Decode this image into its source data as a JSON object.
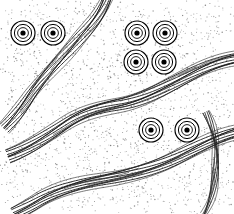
{
  "figure": {
    "width": 234,
    "height": 214,
    "background_color": "#ffffff",
    "line_color": "#1a1a1a",
    "stipple_color": "#6b6b6b",
    "symbol_fill_color": "#000000",
    "symbol_count": 8,
    "band_count": 4,
    "caption": ""
  },
  "chart_data": {
    "type": "diagram",
    "title": "",
    "xlabel": "",
    "ylabel": "",
    "grid": false,
    "legend": "none",
    "symbols": [
      {
        "name": "ring-symbol-1",
        "x": 23,
        "y": 33,
        "radii": [
          12,
          8.6,
          5.4
        ],
        "core_radius": 2.6
      },
      {
        "name": "ring-symbol-2",
        "x": 53,
        "y": 33,
        "radii": [
          12,
          8.6,
          5.4
        ],
        "core_radius": 2.6
      },
      {
        "name": "ring-symbol-3",
        "x": 137,
        "y": 33,
        "radii": [
          12,
          8.6,
          5.4
        ],
        "core_radius": 2.6
      },
      {
        "name": "ring-symbol-4",
        "x": 165,
        "y": 33,
        "radii": [
          12,
          8.6,
          5.4
        ],
        "core_radius": 2.6
      },
      {
        "name": "ring-symbol-5",
        "x": 136,
        "y": 62,
        "radii": [
          12,
          8.6,
          5.4
        ],
        "core_radius": 2.6
      },
      {
        "name": "ring-symbol-6",
        "x": 164,
        "y": 62,
        "radii": [
          12,
          8.6,
          5.4
        ],
        "core_radius": 2.6
      },
      {
        "name": "ring-symbol-7",
        "x": 151,
        "y": 130,
        "radii": [
          12,
          8.6,
          5.4
        ],
        "core_radius": 2.6
      },
      {
        "name": "ring-symbol-8",
        "x": 187,
        "y": 130,
        "radii": [
          12,
          8.6,
          5.4
        ],
        "core_radius": 2.6
      }
    ],
    "bands": [
      {
        "name": "flow-band-upper-left",
        "orientation": "NE-SW",
        "line_count": 9,
        "path": "M 108 -4 C 100 18, 88 28, 76 42 C 62 58, 46 74, 30 96 C 22 108, 14 118, 4 128"
      },
      {
        "name": "flow-band-middle",
        "orientation": "ENE-WSW",
        "line_count": 10,
        "path": "M 238 58 C 214 62, 196 72, 176 82 C 156 92, 140 100, 120 104 C 100 108, 84 112, 66 124 C 48 136, 30 148, 8 156"
      },
      {
        "name": "flow-band-lower",
        "orientation": "ENE-WSW",
        "line_count": 10,
        "path": "M 238 132 C 214 138, 194 150, 172 160 C 150 170, 124 176, 102 180 C 80 184, 58 190, 40 200 C 30 206, 22 210, 14 214"
      },
      {
        "name": "flow-band-lower-right",
        "orientation": "N-S",
        "line_count": 6,
        "path": "M 206 112 C 214 130, 218 150, 216 170 C 214 190, 210 202, 204 214"
      }
    ]
  }
}
